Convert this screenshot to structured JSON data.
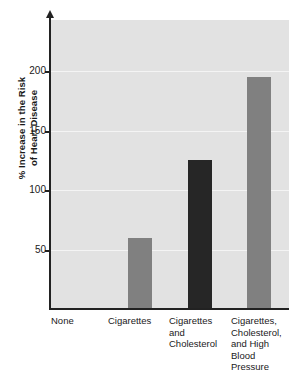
{
  "chart_data": {
    "type": "bar",
    "title": "",
    "subtitle": "",
    "xlabel": "",
    "ylabel": "% Increase in the Risk of Heart Disease",
    "ylabel_lines": [
      "% Increase in the Risk",
      "of Heart Disease"
    ],
    "categories": [
      "None",
      "Cigarettes",
      "Cigarettes and Cholesterol",
      "Cigarettes, Cholesterol, and High Blood Pressure"
    ],
    "category_label_lines": [
      [
        "None"
      ],
      [
        "Cigarettes"
      ],
      [
        "Cigarettes",
        "and",
        "Cholesterol"
      ],
      [
        "Cigarettes,",
        "Cholesterol,",
        "and High",
        "Blood",
        "Pressure"
      ]
    ],
    "values": [
      0,
      60,
      125,
      195
    ],
    "bar_colors": [
      "#e2e2e2",
      "#808080",
      "#262626",
      "#808080"
    ],
    "ylim": [
      0,
      243
    ],
    "yticks": [
      50,
      100,
      150,
      200
    ],
    "ytick_labels": [
      "50",
      "100",
      "150",
      "200"
    ],
    "grid": true,
    "grid_color": "#f4f4f4",
    "legend": "none",
    "plot_background": "#e2e2e2",
    "axis_color": "#222222"
  },
  "figure": {
    "background": "#ffffff"
  }
}
